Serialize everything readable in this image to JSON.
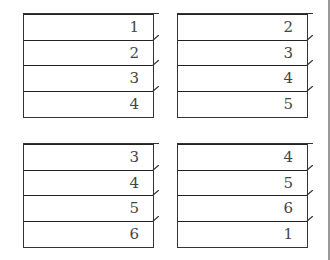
{
  "stacks": [
    {
      "name": "stack-top-left",
      "cells": [
        "1",
        "2",
        "3",
        "4"
      ]
    },
    {
      "name": "stack-top-right",
      "cells": [
        "2",
        "3",
        "4",
        "5"
      ]
    },
    {
      "name": "stack-bottom-left",
      "cells": [
        "3",
        "4",
        "5",
        "6"
      ]
    },
    {
      "name": "stack-bottom-right",
      "cells": [
        "4",
        "5",
        "6",
        "1"
      ]
    }
  ]
}
